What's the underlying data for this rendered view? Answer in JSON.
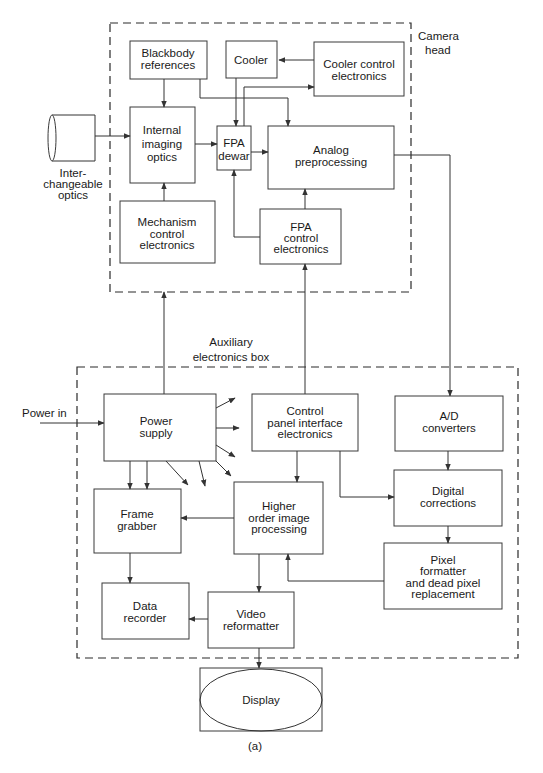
{
  "diagram": {
    "caption": "(a)",
    "regions": {
      "camera_head": {
        "label_line1": "Camera",
        "label_line2": "head"
      },
      "auxiliary": {
        "label_line1": "Auxiliary",
        "label_line2": "electronics box"
      }
    },
    "external": {
      "optics": {
        "line1": "Inter-",
        "line2": "changeable",
        "line3": "optics"
      },
      "power_in": "Power in",
      "display": "Display"
    },
    "blocks": {
      "blackbody": {
        "line1": "Blackbody",
        "line2": "references"
      },
      "cooler": {
        "line1": "Cooler"
      },
      "cooler_control": {
        "line1": "Cooler control",
        "line2": "electronics"
      },
      "internal_optics": {
        "line1": "Internal",
        "line2": "imaging",
        "line3": "optics"
      },
      "fpa_dewar": {
        "line1": "FPA",
        "line2": "dewar"
      },
      "analog": {
        "line1": "Analog",
        "line2": "preprocessing"
      },
      "mechanism": {
        "line1": "Mechanism",
        "line2": "control",
        "line3": "electronics"
      },
      "fpa_control": {
        "line1": "FPA",
        "line2": "control",
        "line3": "electronics"
      },
      "power_supply": {
        "line1": "Power",
        "line2": "supply"
      },
      "control_panel": {
        "line1": "Control",
        "line2": "panel interface",
        "line3": "electronics"
      },
      "ad": {
        "line1": "A/D",
        "line2": "converters"
      },
      "digital": {
        "line1": "Digital",
        "line2": "corrections"
      },
      "frame_grabber": {
        "line1": "Frame",
        "line2": "grabber"
      },
      "higher_order": {
        "line1": "Higher",
        "line2": "order image",
        "line3": "processing"
      },
      "pixel_formatter": {
        "line1": "Pixel",
        "line2": "formatter",
        "line3": "and dead pixel",
        "line4": "replacement"
      },
      "data_recorder": {
        "line1": "Data",
        "line2": "recorder"
      },
      "video_reformatter": {
        "line1": "Video",
        "line2": "reformatter"
      }
    },
    "colors": {
      "line": "#333333",
      "background": "#ffffff",
      "text": "#1a1a1a"
    }
  }
}
